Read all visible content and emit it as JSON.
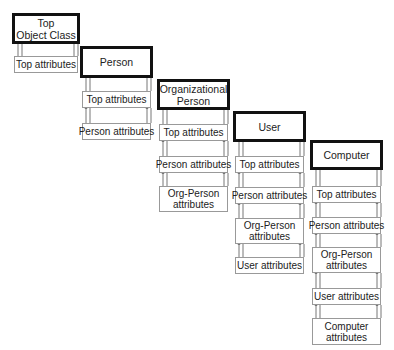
{
  "diagram": {
    "columns": [
      {
        "class": {
          "label": "Top\nObject Class",
          "x": 12,
          "y": 13,
          "w": 68,
          "h": 31
        },
        "attributes": [
          {
            "label": "Top attributes",
            "y": 56,
            "h": 17
          }
        ]
      },
      {
        "class": {
          "label": "Person",
          "x": 80,
          "y": 46,
          "w": 73,
          "h": 32
        },
        "attributes": [
          {
            "label": "Top attributes",
            "y": 91,
            "h": 17
          },
          {
            "label": "Person attributes",
            "y": 123,
            "h": 17
          }
        ]
      },
      {
        "class": {
          "label": "Organizational\nPerson",
          "x": 157,
          "y": 79,
          "w": 73,
          "h": 31
        },
        "attributes": [
          {
            "label": "Top attributes",
            "y": 124,
            "h": 17
          },
          {
            "label": "Person attributes",
            "y": 156,
            "h": 17
          },
          {
            "label": "Org-Person\nattributes",
            "y": 186,
            "h": 26
          }
        ]
      },
      {
        "class": {
          "label": "User",
          "x": 233,
          "y": 111,
          "w": 73,
          "h": 31
        },
        "attributes": [
          {
            "label": "Top attributes",
            "y": 156,
            "h": 17
          },
          {
            "label": "Person attributes",
            "y": 187,
            "h": 17
          },
          {
            "label": "Org-Person\nattributes",
            "y": 218,
            "h": 26
          },
          {
            "label": "User attributes",
            "y": 257,
            "h": 17
          }
        ]
      },
      {
        "class": {
          "label": "Computer",
          "x": 310,
          "y": 140,
          "w": 73,
          "h": 30
        },
        "attributes": [
          {
            "label": "Top attributes",
            "y": 186,
            "h": 17
          },
          {
            "label": "Person attributes",
            "y": 217,
            "h": 17
          },
          {
            "label": "Org-Person\nattributes",
            "y": 247,
            "h": 26
          },
          {
            "label": "User attributes",
            "y": 288,
            "h": 17
          },
          {
            "label": "Computer\nattributes",
            "y": 318,
            "h": 27
          }
        ]
      }
    ]
  }
}
